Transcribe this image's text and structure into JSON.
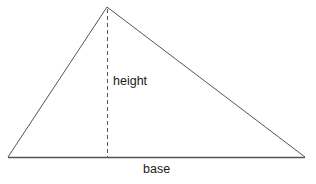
{
  "diagram": {
    "labels": {
      "height": "height",
      "base": "base"
    },
    "vertices": {
      "apex": [
        107,
        7
      ],
      "left": [
        8,
        157
      ],
      "right": [
        305,
        157
      ]
    },
    "height_foot": [
      107,
      157
    ],
    "colors": {
      "stroke": "#555555",
      "text": "#1a1a1a",
      "background": "#ffffff"
    }
  }
}
